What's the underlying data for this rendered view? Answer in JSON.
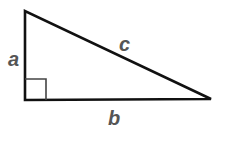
{
  "diagram": {
    "type": "right-triangle",
    "labels": {
      "side_a": "a",
      "side_b": "b",
      "hypotenuse_c": "c"
    },
    "colors": {
      "stroke": "#111111",
      "right_angle_marker": "#444444",
      "label": "#555555",
      "background": "#ffffff"
    }
  }
}
